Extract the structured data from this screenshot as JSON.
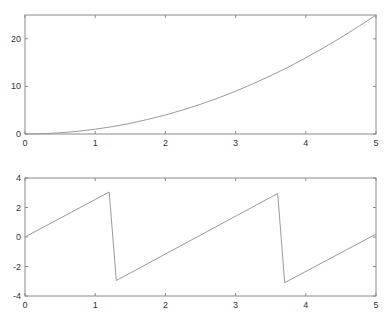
{
  "chart_data": [
    {
      "type": "line",
      "title": "",
      "xlabel": "",
      "ylabel": "",
      "xlim": [
        0,
        5
      ],
      "ylim": [
        0,
        25
      ],
      "grid": false,
      "xticks": [
        0,
        1,
        2,
        3,
        4,
        5
      ],
      "yticks": [
        0,
        10,
        20
      ],
      "xtick_labels": [
        "0",
        "1",
        "2",
        "3",
        "4",
        "5"
      ],
      "ytick_labels": [
        "0",
        "10",
        "20"
      ],
      "series": [
        {
          "name": "y = x^2",
          "x": [
            0,
            0.25,
            0.5,
            0.75,
            1,
            1.25,
            1.5,
            1.75,
            2,
            2.25,
            2.5,
            2.75,
            3,
            3.25,
            3.5,
            3.75,
            4,
            4.25,
            4.5,
            4.75,
            5
          ],
          "y": [
            0,
            0.0625,
            0.25,
            0.5625,
            1,
            1.5625,
            2.25,
            3.0625,
            4,
            5.0625,
            6.25,
            7.5625,
            9,
            10.5625,
            12.25,
            14.0625,
            16,
            18.0625,
            20.25,
            22.5625,
            25
          ]
        }
      ],
      "frame": {
        "left": 25,
        "top": 15,
        "right": 376,
        "bottom": 134
      }
    },
    {
      "type": "line",
      "title": "",
      "xlabel": "",
      "ylabel": "",
      "xlim": [
        0,
        5
      ],
      "ylim": [
        -4,
        4
      ],
      "grid": false,
      "xticks": [
        0,
        1,
        2,
        3,
        4,
        5
      ],
      "yticks": [
        -4,
        -2,
        0,
        2,
        4
      ],
      "xtick_labels": [
        "0",
        "1",
        "2",
        "3",
        "4",
        "5"
      ],
      "ytick_labels": [
        "-4",
        "-2",
        "0",
        "2",
        "4"
      ],
      "series": [
        {
          "name": "sawtooth (wrapped phase)",
          "x": [
            0,
            1.2,
            1.3,
            3.6,
            3.7,
            5
          ],
          "y": [
            0,
            3.05,
            -2.95,
            2.95,
            -3.1,
            0.2
          ]
        }
      ],
      "frame": {
        "left": 25,
        "top": 178,
        "right": 376,
        "bottom": 296
      }
    }
  ],
  "colors": {
    "frame": "#8a8a8a",
    "line": "#9a9a9a",
    "text": "#333333",
    "background": "#ffffff"
  }
}
